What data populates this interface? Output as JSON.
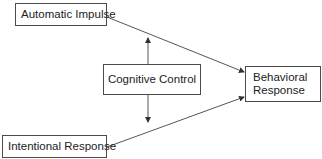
{
  "diagram": {
    "type": "flow",
    "nodes": [
      {
        "id": "automatic",
        "label": "Automatic Impulse"
      },
      {
        "id": "cognitive",
        "label": "Cognitive Control"
      },
      {
        "id": "behavioral",
        "label_lines": [
          "Behavioral",
          "Response"
        ],
        "label": "Behavioral Response"
      },
      {
        "id": "intentional",
        "label": "Intentional Response"
      }
    ],
    "edges": [
      {
        "from": "automatic",
        "to": "behavioral",
        "arrow": "end"
      },
      {
        "from": "intentional",
        "to": "behavioral",
        "arrow": "end"
      },
      {
        "from": "cognitive",
        "to": "automatic-edge",
        "arrow": "end",
        "direction": "up"
      },
      {
        "from": "cognitive",
        "to": "intentional-edge",
        "arrow": "end",
        "direction": "down"
      }
    ],
    "colors": {
      "stroke": "#4a4a4a",
      "text": "#222222",
      "background": "#ffffff"
    }
  }
}
